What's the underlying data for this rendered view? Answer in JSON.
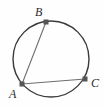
{
  "figure": {
    "background_color": "#fefefe",
    "width": 105,
    "height": 108
  },
  "chart_data": {
    "type": "scatter",
    "xlabel": "",
    "ylabel": "",
    "grid": false,
    "legend": false,
    "xlim": [
      0,
      105
    ],
    "ylim": [
      0,
      108
    ],
    "circle": {
      "name": "circumscribed-circle",
      "center_x": 51,
      "center_y": 59,
      "radius": 38,
      "stroke_color": "#3a3a3a",
      "stroke_width": 1.4,
      "fill": "none"
    },
    "points": [
      {
        "label": "A",
        "x": 22,
        "y": 84,
        "marker": "square",
        "marker_color": "#555555",
        "marker_size": 4
      },
      {
        "label": "B",
        "x": 46,
        "y": 22,
        "marker": "square",
        "marker_color": "#555555",
        "marker_size": 4
      },
      {
        "label": "C",
        "x": 85,
        "y": 79,
        "marker": "square",
        "marker_color": "#555555",
        "marker_size": 4
      }
    ],
    "segments": [
      {
        "name": "chord-AB",
        "from": "A",
        "to": "B",
        "x1": 22,
        "y1": 84,
        "x2": 46,
        "y2": 22,
        "stroke_color": "#6e6e6e",
        "stroke_width": 1.1
      },
      {
        "name": "chord-AC",
        "from": "A",
        "to": "C",
        "x1": 22,
        "y1": 84,
        "x2": 85,
        "y2": 79,
        "stroke_color": "#6e6e6e",
        "stroke_width": 1.1
      }
    ],
    "labels": [
      {
        "text": "A",
        "x": 9,
        "y": 88,
        "style": "italic-serif",
        "color": "#2b2b2b"
      },
      {
        "text": "B",
        "x": 35,
        "y": 6,
        "style": "italic-serif",
        "color": "#2b2b2b"
      },
      {
        "text": "C",
        "x": 91,
        "y": 77,
        "style": "italic-serif",
        "color": "#2b2b2b"
      }
    ]
  },
  "colors": {
    "circle_stroke": "#3a3a3a",
    "chord_stroke": "#6e6e6e",
    "point_marker": "#555555",
    "label_text": "#2b2b2b",
    "background": "#fefefe"
  }
}
